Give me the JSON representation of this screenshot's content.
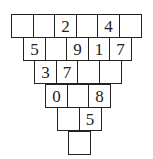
{
  "puzzle": {
    "type": "number-pyramid",
    "rows": [
      [
        "",
        "",
        "2",
        "",
        "4",
        ""
      ],
      [
        "5",
        "",
        "9",
        "1",
        "7"
      ],
      [
        "3",
        "7",
        "",
        ""
      ],
      [
        "0",
        "",
        "8"
      ],
      [
        "",
        "5"
      ],
      [
        ""
      ]
    ]
  }
}
